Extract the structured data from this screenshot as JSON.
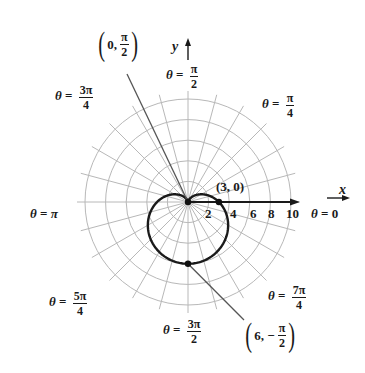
{
  "chart_data": {
    "type": "polar",
    "title": "",
    "equation": "r = 3 - 3 sin θ (cardioid)",
    "grid": {
      "circles": [
        2,
        4,
        6,
        8,
        10
      ],
      "radial_step_deg": 15,
      "rmax": 10
    },
    "axes": {
      "x_label": "x",
      "y_label": "y",
      "x_ticks": [
        "2",
        "4",
        "6",
        "8",
        "10"
      ]
    },
    "curve": {
      "name": "cardioid",
      "a": 3,
      "b": -3,
      "func": "sin"
    },
    "points": [
      {
        "r": 3,
        "theta": "0",
        "label": "(3, 0)"
      },
      {
        "r": 0,
        "theta": "π/2",
        "label_a": "0,",
        "label_num": "π",
        "label_den": "2"
      },
      {
        "r": 6,
        "theta": "-π/2",
        "label_a": "6, −",
        "label_num": "π",
        "label_den": "2"
      }
    ],
    "angle_labels": [
      {
        "id": "a0",
        "theta_sym": "θ",
        "eq": "=",
        "value": "0"
      },
      {
        "id": "a45",
        "theta_sym": "θ",
        "eq": "=",
        "num": "π",
        "den": "4"
      },
      {
        "id": "a90",
        "theta_sym": "θ",
        "eq": "=",
        "num": "π",
        "den": "2"
      },
      {
        "id": "a135",
        "theta_sym": "θ",
        "eq": "=",
        "num": "3π",
        "den": "4"
      },
      {
        "id": "a180",
        "theta_sym": "θ",
        "eq": "=",
        "value": "π"
      },
      {
        "id": "a225",
        "theta_sym": "θ",
        "eq": "=",
        "num": "5π",
        "den": "4"
      },
      {
        "id": "a270",
        "theta_sym": "θ",
        "eq": "=",
        "num": "3π",
        "den": "2"
      },
      {
        "id": "a315",
        "theta_sym": "θ",
        "eq": "=",
        "num": "7π",
        "den": "4"
      }
    ],
    "colors": {
      "grid": "#b8b8b8",
      "curve": "#1a1a1a",
      "axis": "#1a1a1a",
      "leader": "#555555"
    }
  }
}
